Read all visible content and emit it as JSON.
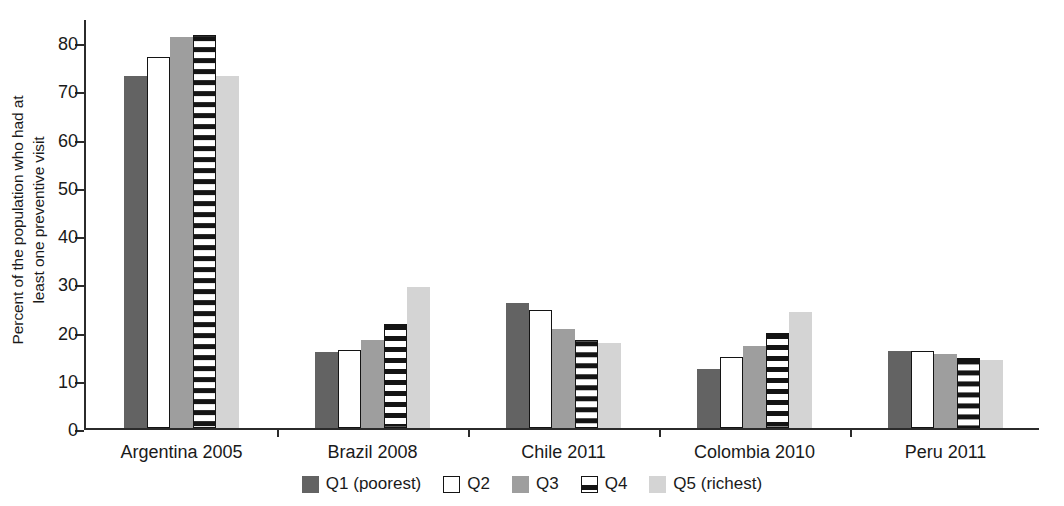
{
  "chart_data": {
    "type": "bar",
    "title": "",
    "xlabel": "",
    "ylabel": "Percent of the population who had at least one preventive visit",
    "ylabel_line1": "Percent of the population who had at",
    "ylabel_line2": "least one preventive visit",
    "ylim": [
      0,
      85
    ],
    "yticks": [
      0,
      10,
      20,
      30,
      40,
      50,
      60,
      70,
      80
    ],
    "ytick_labels": [
      "0",
      "10",
      "20",
      "30",
      "40",
      "50",
      "60",
      "70",
      "80"
    ],
    "grid": false,
    "legend_position": "bottom",
    "categories": [
      "Argentina 2005",
      "Brazil 2008",
      "Chile 2011",
      "Colombia 2010",
      "Peru 2011"
    ],
    "series": [
      {
        "name": "Q1 (poorest)",
        "key": "q1",
        "color": "#636363",
        "values": [
          73.0,
          15.8,
          26.0,
          12.3,
          16.0
        ]
      },
      {
        "name": "Q2",
        "key": "q2",
        "color": "#ffffff",
        "values": [
          77.0,
          16.2,
          24.4,
          14.8,
          16.0
        ]
      },
      {
        "name": "Q3",
        "key": "q3",
        "color": "#9e9e9e",
        "values": [
          81.0,
          18.3,
          20.6,
          17.0,
          15.3
        ]
      },
      {
        "name": "Q4",
        "key": "q4",
        "color": "#ffffff",
        "values": [
          81.5,
          21.5,
          18.3,
          19.6,
          14.6
        ]
      },
      {
        "name": "Q5 (richest)",
        "key": "q5",
        "color": "#d4d4d4",
        "values": [
          73.0,
          29.2,
          17.7,
          24.0,
          14.0
        ]
      }
    ]
  }
}
